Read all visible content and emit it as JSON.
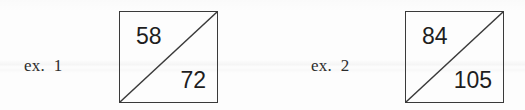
{
  "page": {
    "background_color": "#fdfdfd",
    "ink_color": "#3a3a3a",
    "text_color": "#1e1e1e"
  },
  "examples": [
    {
      "label": "ex.  1",
      "figure": {
        "shape": "square-with-diagonal",
        "diagonal_direction": "bottom-left-to-top-right",
        "upper_left_value": "58",
        "lower_right_value": "72"
      }
    },
    {
      "label": "ex.  2",
      "figure": {
        "shape": "square-with-diagonal",
        "diagonal_direction": "bottom-left-to-top-right",
        "upper_left_value": "84",
        "lower_right_value": "105"
      }
    }
  ]
}
